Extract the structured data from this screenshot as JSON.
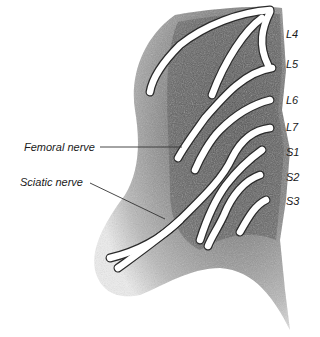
{
  "diagram": {
    "colors": {
      "background": "#ffffff",
      "shading_dark": "#555555",
      "shading_mid": "#9a9a9a",
      "nerve_fill": "#ffffff",
      "nerve_outline": "#2a2a2a",
      "label_text": "#1a1a1a"
    },
    "root_labels": [
      {
        "id": "L4",
        "text": "L4",
        "x": 286,
        "y": 34
      },
      {
        "id": "L5",
        "text": "L5",
        "x": 286,
        "y": 62
      },
      {
        "id": "L6",
        "text": "L6",
        "x": 286,
        "y": 97
      },
      {
        "id": "L7",
        "text": "L7",
        "x": 286,
        "y": 123
      },
      {
        "id": "S1",
        "text": "S1",
        "x": 286,
        "y": 148
      },
      {
        "id": "S2",
        "text": "S2",
        "x": 286,
        "y": 173
      },
      {
        "id": "S3",
        "text": "S3",
        "x": 286,
        "y": 197
      }
    ],
    "callouts": [
      {
        "id": "femoral",
        "text": "Femoral nerve",
        "x": 24,
        "y": 141,
        "line": {
          "x1": 100,
          "y1": 147,
          "x2": 182,
          "y2": 147
        }
      },
      {
        "id": "sciatic",
        "text": "Sciatic nerve",
        "x": 20,
        "y": 176,
        "line": {
          "x1": 90,
          "y1": 183,
          "x2": 165,
          "y2": 219
        }
      }
    ]
  }
}
